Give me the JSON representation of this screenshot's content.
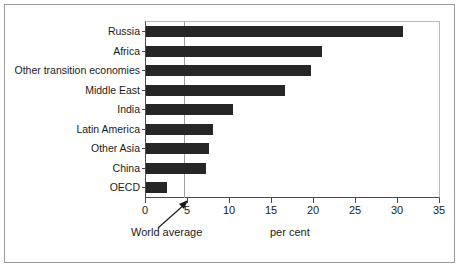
{
  "figure": {
    "cut_off_title_fragment": "",
    "axis_caption": "per cent",
    "annotation_label": "World average"
  },
  "chart_data": {
    "type": "bar",
    "orientation": "horizontal",
    "title": "",
    "xlabel": "per cent",
    "ylabel": "",
    "xlim": [
      0,
      35
    ],
    "xticks": [
      0,
      5,
      10,
      15,
      20,
      25,
      30,
      35
    ],
    "xtick_labels": [
      "0",
      "5",
      "10",
      "15",
      "20",
      "25",
      "30",
      "35"
    ],
    "grid": false,
    "legend": null,
    "bar_color": "#262626",
    "categories": [
      "Russia",
      "Africa",
      "Other transition economies",
      "Middle East",
      "India",
      "Latin America",
      "Other Asia",
      "China",
      "OECD"
    ],
    "values": [
      30.6,
      20.9,
      19.7,
      16.5,
      10.4,
      8.0,
      7.5,
      7.2,
      2.5
    ],
    "annotations": [
      {
        "label": "World average",
        "type": "vline",
        "x": 4.7,
        "color": "#9e9e9e"
      }
    ]
  }
}
